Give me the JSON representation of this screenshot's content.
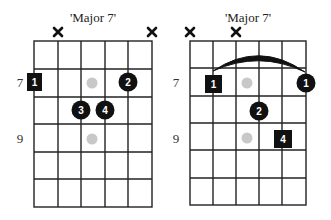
{
  "diagrams": [
    {
      "title": "'Major 7'",
      "fret_labels": [
        {
          "fret": 7,
          "label": "7"
        },
        {
          "fret": 9,
          "label": "9"
        }
      ],
      "muted_strings": [
        2,
        6
      ],
      "barre": null,
      "notes": [
        {
          "string": 1,
          "pos": "fret7",
          "shape": "square",
          "label": "1"
        },
        {
          "string": 3,
          "pos": "fret7",
          "shape": "ghost",
          "label": ""
        },
        {
          "string": 5,
          "pos": "fret7",
          "shape": "circle",
          "label": "2"
        },
        {
          "string": 3,
          "pos": "fret8",
          "shape": "circle",
          "label": "3"
        },
        {
          "string": 4,
          "pos": "fret8",
          "shape": "circle",
          "label": "4"
        },
        {
          "string": 3,
          "pos": "fret9",
          "shape": "ghost",
          "label": ""
        }
      ],
      "labels": {
        "n0": "1",
        "n2": "2",
        "n3": "3",
        "n4": "4",
        "fret7": "7",
        "fret9": "9"
      }
    },
    {
      "title": "'Major 7'",
      "fret_labels": [
        {
          "fret": 7,
          "label": "7"
        },
        {
          "fret": 9,
          "label": "9"
        }
      ],
      "muted_strings": [
        1,
        3
      ],
      "barre": {
        "from_string": 2,
        "to_string": 6,
        "fret": 7
      },
      "notes": [
        {
          "string": 2,
          "pos": "fret7",
          "shape": "square",
          "label": "1"
        },
        {
          "string": 3,
          "pos": "fret7",
          "shape": "ghost",
          "label": ""
        },
        {
          "string": 6,
          "pos": "fret7",
          "shape": "circle",
          "label": "1"
        },
        {
          "string": 4,
          "pos": "fret8",
          "shape": "circle",
          "label": "2"
        },
        {
          "string": 3,
          "pos": "fret9",
          "shape": "ghost",
          "label": ""
        },
        {
          "string": 5,
          "pos": "fret9",
          "shape": "square",
          "label": "4"
        }
      ],
      "labels": {
        "n0": "1",
        "n2": "1",
        "n3": "2",
        "n5": "4",
        "fret7": "7",
        "fret9": "9"
      }
    }
  ],
  "colors": {
    "grid": "#222222",
    "note": "#111111",
    "ghost": "#c8c8c8",
    "text": "#ffffff"
  }
}
